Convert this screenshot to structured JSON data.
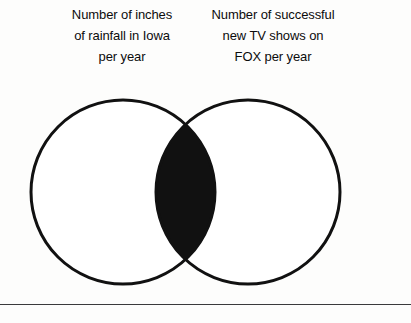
{
  "page": {
    "background_color": "#fdfdfc",
    "width": 411,
    "height": 323
  },
  "captions": {
    "left": {
      "lines": [
        "Number of inches",
        "of rainfall in Iowa",
        "per year"
      ]
    },
    "right": {
      "lines": [
        "Number of successful",
        "new TV shows on",
        "FOX per year"
      ]
    }
  },
  "chart_data": {
    "type": "venn",
    "title": "",
    "sets": [
      {
        "name": "left-set",
        "label": "Number of inches of rainfall in Iowa per year",
        "center_x": 123,
        "center_y": 192,
        "radius": 92,
        "fill": "#ffffff",
        "stroke": "#111111"
      },
      {
        "name": "right-set",
        "label": "Number of successful new TV shows on FOX per year",
        "center_x": 248,
        "center_y": 192,
        "radius": 92,
        "fill": "#ffffff",
        "stroke": "#111111"
      }
    ],
    "intersection": {
      "label": "",
      "fill": "#111111",
      "highlighted": true
    },
    "stroke_width": 3,
    "legend": "none",
    "grid": false
  },
  "rule": {
    "color": "#3a3a3c",
    "thickness": 1
  }
}
